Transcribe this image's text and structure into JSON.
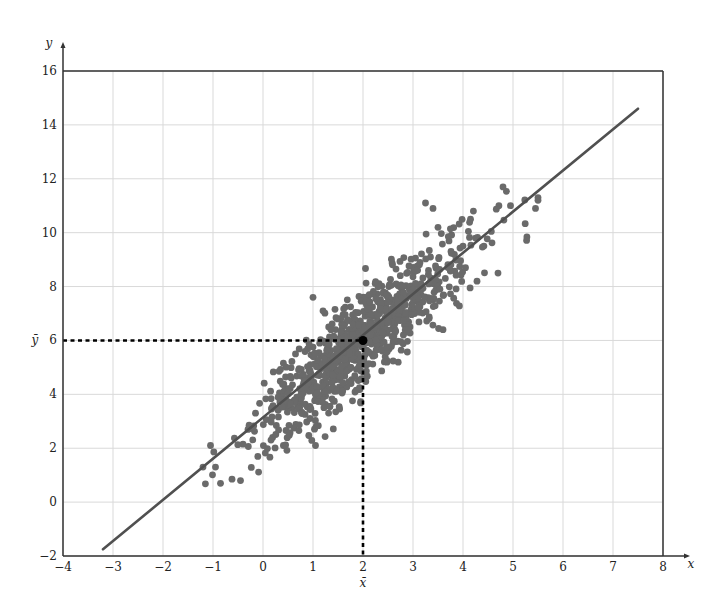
{
  "chart_data": {
    "type": "scatter",
    "title": "",
    "xlabel": "x",
    "ylabel": "y",
    "xlim": [
      -4,
      8
    ],
    "ylim": [
      -2,
      16
    ],
    "grid": true,
    "x_ticks": [
      -4,
      -3,
      -2,
      -1,
      0,
      1,
      2,
      3,
      4,
      5,
      6,
      7,
      8
    ],
    "y_ticks": [
      -2,
      0,
      2,
      4,
      6,
      8,
      10,
      12,
      14,
      16
    ],
    "x_tick_labels": [
      "−4",
      "−3",
      "−2",
      "−1",
      "0",
      "1",
      "2",
      "3",
      "4",
      "5",
      "6",
      "7",
      "8"
    ],
    "y_tick_labels": [
      "−2",
      "0",
      "2",
      "4",
      "6",
      "8",
      "10",
      "12",
      "14",
      "16"
    ],
    "mean": {
      "x": 2,
      "y": 6,
      "x_label": "x̄",
      "y_label": "ȳ"
    },
    "regression_line": {
      "x_start": -3.2,
      "y_start": -1.75,
      "x_end": 7.5,
      "y_end": 14.6,
      "slope": 1.53,
      "intercept": 2.94
    },
    "scatter": {
      "n": 900,
      "seed": 7,
      "x_mean": 2.0,
      "x_std": 1.05,
      "residual_std": 0.85,
      "note": "synthetic bivariate normal cloud centered at the mean, approximated",
      "notable_points": [
        [
          -1.2,
          1.3
        ],
        [
          -1.05,
          2.1
        ],
        [
          -0.95,
          1.3
        ],
        [
          -0.85,
          0.7
        ],
        [
          -0.45,
          0.8
        ],
        [
          -0.3,
          2.7
        ],
        [
          -0.15,
          3.3
        ],
        [
          1.05,
          2.1
        ],
        [
          1.0,
          7.6
        ],
        [
          1.2,
          7.1
        ],
        [
          3.25,
          11.1
        ],
        [
          3.4,
          10.9
        ],
        [
          3.5,
          10.2
        ],
        [
          4.8,
          11.7
        ],
        [
          5.5,
          11.3
        ],
        [
          5.45,
          10.9
        ],
        [
          4.95,
          11.0
        ],
        [
          5.5,
          11.2
        ],
        [
          4.7,
          8.5
        ],
        [
          4.05,
          8.7
        ],
        [
          3.6,
          6.4
        ],
        [
          2.9,
          6.4
        ],
        [
          2.85,
          7.0
        ],
        [
          4.0,
          9.5
        ],
        [
          4.25,
          9.8
        ]
      ]
    },
    "colors": {
      "points": "#6a6a6a",
      "line": "#505050",
      "mean_marker": "#000000",
      "grid": "#d9d9d9",
      "frame": "#333333"
    }
  }
}
